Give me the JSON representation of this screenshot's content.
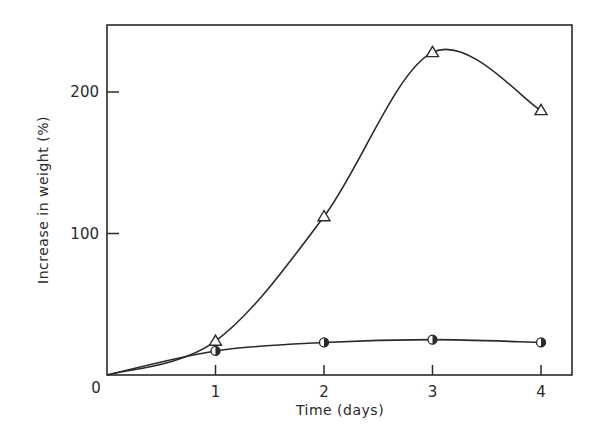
{
  "chart_data": {
    "type": "line",
    "title": "",
    "xlabel": "Time (days)",
    "ylabel": "Increase in weight (%)",
    "x": [
      0,
      1,
      2,
      3,
      4
    ],
    "x_ticks": [
      "0",
      "1",
      "2",
      "3",
      "4"
    ],
    "y_ticks": [
      "0",
      "100",
      "200"
    ],
    "xlim": [
      0,
      4.3
    ],
    "ylim": [
      0,
      245
    ],
    "grid": false,
    "legend": "none",
    "series": [
      {
        "name": "triangles",
        "marker": "triangle-open",
        "values": [
          0,
          24,
          112,
          228,
          187
        ]
      },
      {
        "name": "half-filled circles",
        "marker": "circle-half-filled",
        "values": [
          0,
          17,
          23,
          25,
          23
        ]
      }
    ]
  },
  "colors": {
    "ink": "#2a2a2a",
    "background": "#ffffff"
  }
}
